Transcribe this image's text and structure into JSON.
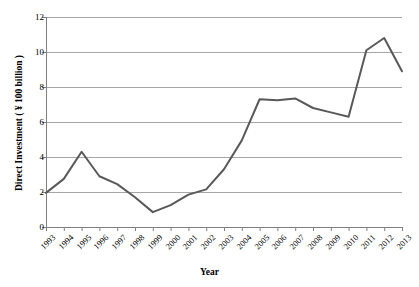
{
  "chart_data": {
    "type": "line",
    "title": "",
    "xlabel": "Year",
    "ylabel": "Direct Investment ( ¥ 100 billion )",
    "categories": [
      "1993",
      "1994",
      "1995",
      "1996",
      "1997",
      "1998",
      "1999",
      "2000",
      "2001",
      "2002",
      "2003",
      "2004",
      "2005",
      "2006",
      "2007",
      "2008",
      "2009",
      "2010",
      "2011",
      "2012",
      "2013"
    ],
    "values": [
      1.95,
      2.75,
      4.3,
      2.9,
      2.45,
      1.7,
      0.85,
      1.25,
      1.85,
      2.15,
      3.3,
      4.95,
      7.3,
      7.25,
      7.35,
      6.8,
      6.55,
      6.3,
      10.1,
      10.8,
      8.9
    ],
    "series": [
      {
        "name": "Direct Investment",
        "color": "#595959",
        "values": [
          1.95,
          2.75,
          4.3,
          2.9,
          2.45,
          1.7,
          0.85,
          1.25,
          1.85,
          2.15,
          3.3,
          4.95,
          7.3,
          7.25,
          7.35,
          6.8,
          6.55,
          6.3,
          10.1,
          10.8,
          8.9
        ]
      }
    ],
    "ylim": [
      0,
      12
    ],
    "yticks": [
      0,
      2,
      4,
      6,
      8,
      10,
      12
    ],
    "ytick_labels": [
      "0",
      "2",
      "4",
      "6",
      "8",
      "10",
      "12"
    ],
    "grid": true,
    "grid_axis": "y",
    "grid_color": "#a6a6a6",
    "legend": "none",
    "axis_color": "#808080",
    "line_width": 2
  },
  "axes": {
    "plot_left": 46,
    "plot_right": 402,
    "plot_top": 17,
    "plot_bottom": 227
  }
}
